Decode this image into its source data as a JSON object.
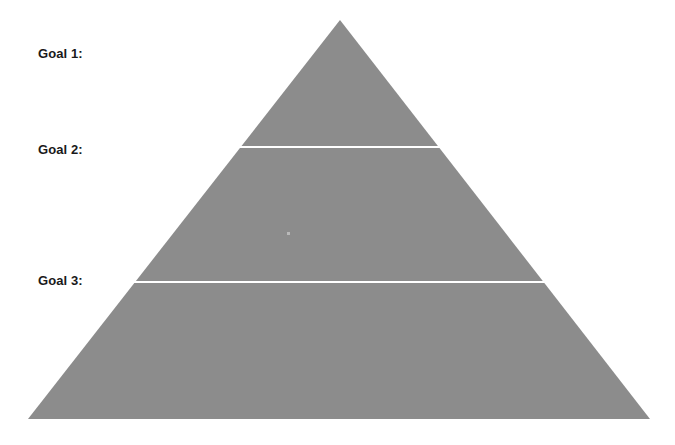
{
  "canvas": {
    "width": 675,
    "height": 445,
    "background_color": "#ffffff"
  },
  "diagram": {
    "type": "pyramid",
    "name": "goal-pyramid",
    "fill_color": "#8c8c8c",
    "divider_color": "#ffffff",
    "divider_width_px": 2,
    "apex": {
      "x": 340,
      "y": 20
    },
    "base_left": {
      "x": 28,
      "y": 419
    },
    "base_right": {
      "x": 650,
      "y": 419
    },
    "dividers": [
      {
        "y": 147,
        "x_start": 232,
        "x_end": 445
      },
      {
        "y": 282,
        "x_start": 124,
        "x_end": 554
      }
    ]
  },
  "labels": [
    {
      "id": "goal-1",
      "text": "Goal 1:",
      "x": 38,
      "y": 46
    },
    {
      "id": "goal-2",
      "text": "Goal 2:",
      "x": 38,
      "y": 142
    },
    {
      "id": "goal-3",
      "text": "Goal 3:",
      "x": 38,
      "y": 273
    }
  ],
  "artifacts": [
    {
      "id": "speck",
      "x": 287,
      "y": 232,
      "color": "#b9b9b9"
    }
  ]
}
